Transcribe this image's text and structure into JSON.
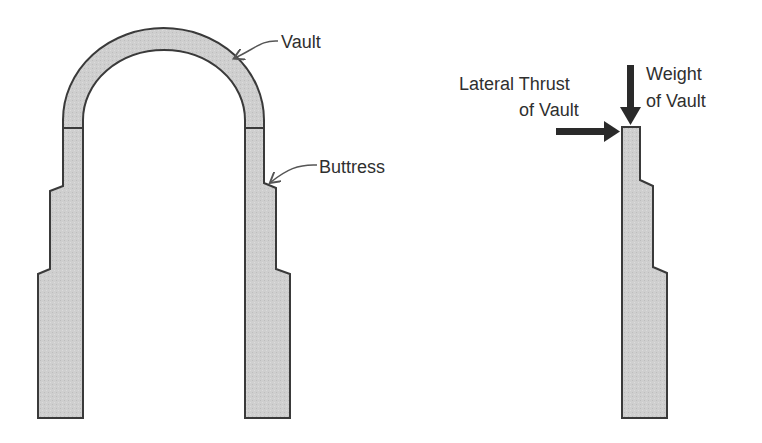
{
  "diagram": {
    "labels": {
      "vault": "Vault",
      "buttress": "Buttress",
      "lateral_thrust_line1": "Lateral Thrust",
      "lateral_thrust_line2": "of Vault",
      "weight_line1": "Weight",
      "weight_line2": "of Vault"
    },
    "colors": {
      "fill": "#cfcfcf",
      "stroke": "#3a3a3a",
      "arrow": "#2a2a2a",
      "text": "#2f2f2f"
    }
  }
}
